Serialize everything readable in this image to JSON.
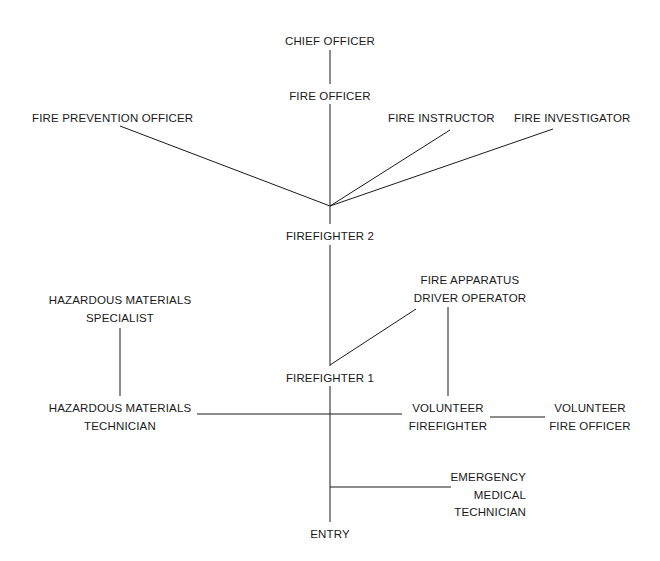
{
  "diagram": {
    "background_color": "#ffffff",
    "line_color": "#1a1a1a",
    "text_color": "#1a1a1a",
    "nodes": [
      {
        "id": "chief-officer",
        "lines": [
          "CHIEF OFFICER"
        ],
        "x": 330,
        "y": 33,
        "align": "center"
      },
      {
        "id": "fire-officer",
        "lines": [
          "FIRE OFFICER"
        ],
        "x": 330,
        "y": 88,
        "align": "center"
      },
      {
        "id": "fire-prevention-officer",
        "lines": [
          "FIRE PREVENTION OFFICER"
        ],
        "x": 32,
        "y": 110,
        "align": "left"
      },
      {
        "id": "fire-instructor",
        "lines": [
          "FIRE INSTRUCTOR"
        ],
        "x": 388,
        "y": 110,
        "align": "left"
      },
      {
        "id": "fire-investigator",
        "lines": [
          "FIRE INVESTIGATOR"
        ],
        "x": 514,
        "y": 110,
        "align": "left"
      },
      {
        "id": "firefighter-2",
        "lines": [
          "FIREFIGHTER 2"
        ],
        "x": 330,
        "y": 228,
        "align": "center"
      },
      {
        "id": "fire-apparatus-driver-operator",
        "lines": [
          "FIRE APPARATUS",
          "DRIVER OPERATOR"
        ],
        "x": 470,
        "y": 272,
        "align": "center"
      },
      {
        "id": "hazardous-materials-specialist",
        "lines": [
          "HAZARDOUS MATERIALS",
          "SPECIALIST"
        ],
        "x": 120,
        "y": 292,
        "align": "center"
      },
      {
        "id": "firefighter-1",
        "lines": [
          "FIREFIGHTER 1"
        ],
        "x": 330,
        "y": 370,
        "align": "center"
      },
      {
        "id": "hazardous-materials-technician",
        "lines": [
          "HAZARDOUS MATERIALS",
          "TECHNICIAN"
        ],
        "x": 120,
        "y": 400,
        "align": "center"
      },
      {
        "id": "volunteer-firefighter",
        "lines": [
          "VOLUNTEER",
          "FIREFIGHTER"
        ],
        "x": 448,
        "y": 400,
        "align": "center"
      },
      {
        "id": "volunteer-fire-officer",
        "lines": [
          "VOLUNTEER",
          "FIRE OFFICER"
        ],
        "x": 590,
        "y": 400,
        "align": "center"
      },
      {
        "id": "emergency-medical-technician",
        "lines": [
          "EMERGENCY",
          "MEDICAL",
          "TECHNICIAN"
        ],
        "x": 526,
        "y": 469,
        "align": "right"
      },
      {
        "id": "entry",
        "lines": [
          "ENTRY"
        ],
        "x": 330,
        "y": 526,
        "align": "center"
      }
    ],
    "connectors": [
      {
        "id": "chief-officer-to-fire-officer",
        "from": "chief-officer",
        "to": "fire-officer",
        "x1": 330,
        "y1": 50,
        "x2": 330,
        "y2": 84
      },
      {
        "id": "fire-officer-to-firefighter-2",
        "from": "fire-officer",
        "to": "firefighter-2",
        "x1": 330,
        "y1": 104,
        "x2": 330,
        "y2": 224
      },
      {
        "id": "fire-prevention-officer-to-firefighter-2",
        "from": "fire-prevention-officer",
        "to": "firefighter-2",
        "x1": 120,
        "y1": 126,
        "x2": 330,
        "y2": 206
      },
      {
        "id": "fire-instructor-to-firefighter-2",
        "from": "fire-instructor",
        "to": "firefighter-2",
        "x1": 450,
        "y1": 130,
        "x2": 330,
        "y2": 206
      },
      {
        "id": "fire-investigator-to-firefighter-2",
        "from": "fire-investigator",
        "to": "firefighter-2",
        "x1": 553,
        "y1": 129,
        "x2": 330,
        "y2": 206
      },
      {
        "id": "firefighter-2-to-firefighter-1",
        "from": "firefighter-2",
        "to": "firefighter-1",
        "x1": 330,
        "y1": 245,
        "x2": 330,
        "y2": 366
      },
      {
        "id": "firefighter-1-to-driver-operator",
        "from": "firefighter-1",
        "to": "fire-apparatus-driver-operator",
        "x1": 330,
        "y1": 365,
        "x2": 416,
        "y2": 309
      },
      {
        "id": "driver-operator-to-volunteer-firefighter",
        "from": "fire-apparatus-driver-operator",
        "to": "volunteer-firefighter",
        "x1": 448,
        "y1": 307,
        "x2": 448,
        "y2": 396
      },
      {
        "id": "hazmat-specialist-to-hazmat-technician",
        "from": "hazardous-materials-specialist",
        "to": "hazardous-materials-technician",
        "x1": 120,
        "y1": 328,
        "x2": 120,
        "y2": 396
      },
      {
        "id": "hazmat-technician-to-main-stem",
        "from": "hazardous-materials-technician",
        "to": "entry-stem",
        "x1": 197,
        "y1": 414,
        "x2": 402,
        "y2": 414
      },
      {
        "id": "volunteer-firefighter-to-volunteer-fire-officer",
        "from": "volunteer-firefighter",
        "to": "volunteer-fire-officer",
        "x1": 490,
        "y1": 417,
        "x2": 545,
        "y2": 417
      },
      {
        "id": "firefighter-1-to-entry",
        "from": "firefighter-1",
        "to": "entry",
        "x1": 330,
        "y1": 386,
        "x2": 330,
        "y2": 522
      },
      {
        "id": "entry-stem-to-emergency-medical-technician",
        "from": "entry",
        "to": "emergency-medical-technician",
        "x1": 330,
        "y1": 487,
        "x2": 451,
        "y2": 487
      }
    ]
  }
}
